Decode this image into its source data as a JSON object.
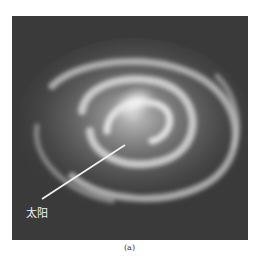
{
  "figure": {
    "annotation_label": "太阳",
    "caption": "(a)",
    "colors": {
      "background": "#3a3a3a",
      "galaxy_glow": "#d8d8d8",
      "pointer_line": "#f5f5f5"
    }
  }
}
